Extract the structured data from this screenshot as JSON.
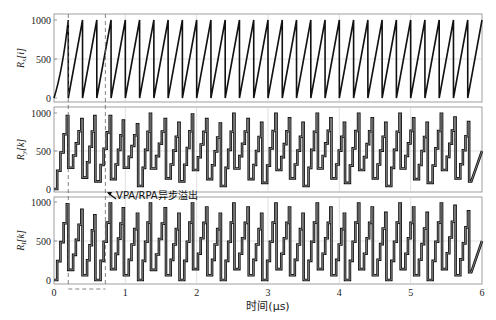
{
  "chart_data": [
    {
      "type": "line",
      "panel": 1,
      "ylabel": "Rx[i]",
      "ylabel_main": "R",
      "ylabel_sub": "x",
      "ylabel_idx": "[i]",
      "yticks": [
        0,
        500,
        1000
      ],
      "ylim": [
        0,
        1024
      ],
      "xlim": [
        0,
        6
      ],
      "grid": true,
      "description": "Sawtooth ramp 0->1000 (first ramp curved, reaching 1000 at ~0.2 μs), then period ~0.2 μs, 30 teeth",
      "first_peak_x": 0.2,
      "period_us": 0.2,
      "peak": 1000
    },
    {
      "type": "line",
      "panel": 2,
      "ylabel": "Ry[k]",
      "ylabel_main": "R",
      "ylabel_sub": "y",
      "ylabel_idx": "[k]",
      "yticks": [
        0,
        500,
        1000
      ],
      "ylim": [
        0,
        1024
      ],
      "xlim": [
        0,
        6
      ],
      "grid": true,
      "description": "Staircase ramp with wrap-around (peaks ~850-980, troughs ~50-280), ~4-5 steps per cycle",
      "peaks_x": [
        0.2,
        0.4,
        0.58,
        0.8,
        0.98,
        1.18,
        1.36,
        1.57,
        1.76,
        1.95,
        2.15,
        2.34,
        2.53,
        2.73,
        2.92,
        3.12,
        3.31,
        3.5,
        3.7,
        3.89,
        4.08,
        4.28,
        4.47,
        4.66,
        4.86,
        5.05,
        5.24,
        5.44,
        5.63,
        5.82
      ],
      "peaks_y": [
        960,
        920,
        960,
        960,
        900,
        850,
        990,
        920,
        870,
        980,
        920,
        860,
        990,
        920,
        870,
        990,
        930,
        870,
        990,
        930,
        870,
        990,
        930,
        870,
        990,
        930,
        870,
        990,
        940,
        880
      ],
      "troughs_y": [
        0,
        280,
        150,
        100,
        130,
        280,
        40,
        270,
        140,
        100,
        250,
        130,
        40,
        270,
        130,
        80,
        250,
        140,
        40,
        270,
        140,
        80,
        250,
        140,
        40,
        270,
        130,
        80,
        250,
        140
      ]
    },
    {
      "type": "line",
      "panel": 3,
      "ylabel": "RI[k]",
      "ylabel_main": "R",
      "ylabel_sub": "I",
      "ylabel_idx": "[k]",
      "yticks": [
        0,
        500,
        1000
      ],
      "ylim": [
        0,
        1024
      ],
      "xlim": [
        0,
        6
      ],
      "xticks": [
        0,
        1,
        2,
        3,
        4,
        5,
        6
      ],
      "xlabel": "时间(μs)",
      "grid": true,
      "description": "Staircase ramp similar to panel 2, shifted in phase",
      "peaks_x": [
        0.2,
        0.4,
        0.58,
        0.8,
        0.98,
        1.18,
        1.36,
        1.57,
        1.76,
        1.95,
        2.15,
        2.34,
        2.53,
        2.73,
        2.92,
        3.12,
        3.31,
        3.5,
        3.7,
        3.89,
        4.08,
        4.28,
        4.47,
        4.66,
        4.86,
        5.05,
        5.24,
        5.44,
        5.63,
        5.82
      ],
      "peaks_y": [
        970,
        900,
        830,
        980,
        920,
        850,
        980,
        920,
        850,
        980,
        930,
        850,
        980,
        930,
        850,
        980,
        930,
        850,
        980,
        930,
        850,
        980,
        930,
        860,
        980,
        930,
        860,
        980,
        950,
        880
      ],
      "troughs_y": [
        0,
        130,
        60,
        0,
        140,
        60,
        0,
        130,
        60,
        0,
        140,
        60,
        0,
        140,
        60,
        0,
        140,
        60,
        0,
        140,
        60,
        0,
        140,
        60,
        0,
        140,
        60,
        0,
        140,
        60
      ]
    }
  ],
  "annotation": {
    "text": "VPA/RPA异步溢出",
    "arrow_target_x": 0.73
  },
  "markers": {
    "dashed_lines_x": [
      0.2,
      0.72
    ]
  },
  "axis": {
    "xlabel": "时间(μs)",
    "xticks": [
      "0",
      "1",
      "2",
      "3",
      "4",
      "5",
      "6"
    ],
    "yticks": [
      "0",
      "500",
      "1000"
    ]
  }
}
